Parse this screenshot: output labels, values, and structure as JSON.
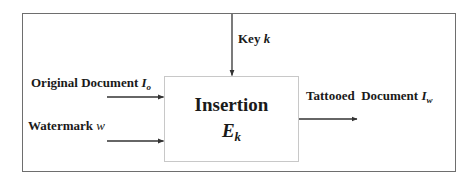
{
  "diagram": {
    "block": {
      "title": "Insertion",
      "function_symbol": "E",
      "function_subscript": "k"
    },
    "inputs": [
      {
        "label": "Original Document ",
        "symbol": "I",
        "subscript": "o"
      },
      {
        "label": "Watermark ",
        "symbol": "w"
      }
    ],
    "key": {
      "label": "Key ",
      "symbol": "k"
    },
    "output": {
      "label": "Tattooed  Document ",
      "symbol": "I",
      "subscript": "w"
    },
    "colors": {
      "frame": "#6e6e6e",
      "box": "#c8c8c8",
      "arrow": "#333333",
      "text": "#1a1a1a"
    }
  }
}
